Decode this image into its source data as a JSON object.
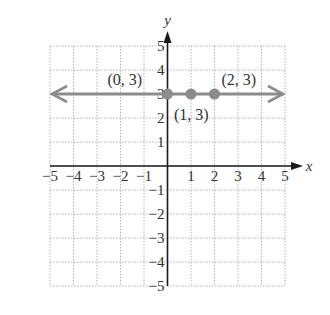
{
  "chart_data": {
    "type": "line",
    "title": "",
    "xlabel": "x",
    "ylabel": "y",
    "xlim": [
      -5,
      5
    ],
    "ylim": [
      -5,
      5
    ],
    "grid": true,
    "x_ticks": [
      -5,
      -4,
      -3,
      -2,
      -1,
      1,
      2,
      3,
      4,
      5
    ],
    "y_ticks": [
      -5,
      -4,
      -3,
      -2,
      -1,
      1,
      2,
      3,
      4,
      5
    ],
    "x_tick_labels": [
      "−5",
      "−4",
      "−3",
      "−2",
      "−1",
      "1",
      "2",
      "3",
      "4",
      "5"
    ],
    "y_tick_labels": [
      "−5",
      "−4",
      "−3",
      "−2",
      "−1",
      "1",
      "2",
      "3",
      "4",
      "5"
    ],
    "line": {
      "equation": "y = 3",
      "y": 3,
      "arrows_both_ends": true
    },
    "series": [
      {
        "name": "y = 3",
        "points": [
          {
            "x": 0,
            "y": 3,
            "label": "(0, 3)"
          },
          {
            "x": 1,
            "y": 3,
            "label": "(1, 3)"
          },
          {
            "x": 2,
            "y": 3,
            "label": "(2, 3)"
          }
        ]
      }
    ],
    "colors": {
      "line": "#8c8c8c",
      "points": "#8c8c8c",
      "axes": "#1a1a1a",
      "grid": "#b5b5b5"
    }
  }
}
